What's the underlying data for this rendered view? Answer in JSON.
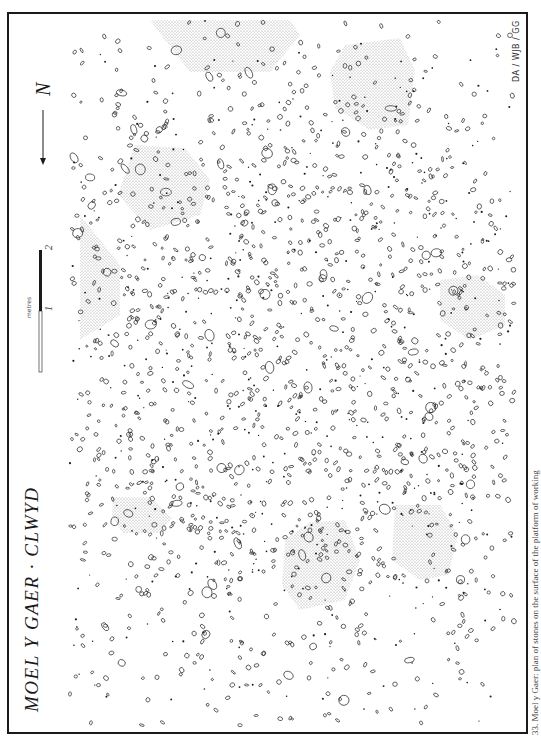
{
  "figure": {
    "title": "MOEL Y GAER · CLWYD",
    "credit": "DA / WJB / GG",
    "caption": "33. Moel y Gaer: plan of stones on the surface of the platform of working",
    "north_label": "N",
    "scale": {
      "unit_label": "metres",
      "ticks": [
        "1",
        "2"
      ]
    }
  },
  "colors": {
    "ink": "#1a1a1a",
    "stipple": "#9a9a9a",
    "paper": "#ffffff"
  },
  "frame": {
    "x": 8,
    "y": 13,
    "width": 519,
    "height": 720
  },
  "stippled_areas": [
    {
      "id": "top-center",
      "points": "150,20 290,20 300,35 270,72 190,72 165,40"
    },
    {
      "id": "top-right",
      "points": "345,45 400,38 415,70 408,125 370,130 335,108 330,72"
    },
    {
      "id": "left-upper-triangle",
      "points": "80,215 120,265 120,315 80,340"
    },
    {
      "id": "left-mid-hex",
      "points": "135,145 185,148 210,180 200,215 150,230 118,195"
    },
    {
      "id": "right-mid-oval",
      "points": "440,280 478,275 505,295 505,325 470,340 440,320"
    },
    {
      "id": "left-lower",
      "points": "113,497 150,497 172,518 160,533 123,533 112,516"
    },
    {
      "id": "bottom-center-left",
      "points": "310,522 345,520 360,560 345,600 300,610 282,585 285,540"
    },
    {
      "id": "bottom-center-right",
      "points": "395,505 440,505 458,535 448,575 420,580 392,560"
    }
  ],
  "stones": {
    "seed": 33,
    "count": 1900,
    "dense_center": {
      "x": 300,
      "y": 370,
      "rx": 180,
      "ry": 200
    }
  },
  "north_arrow": {
    "x": 43,
    "y1": 100,
    "y2": 158
  },
  "scale_bar": {
    "x": 40,
    "y_top": 250,
    "y_mid": 311,
    "y_bottom": 372
  }
}
